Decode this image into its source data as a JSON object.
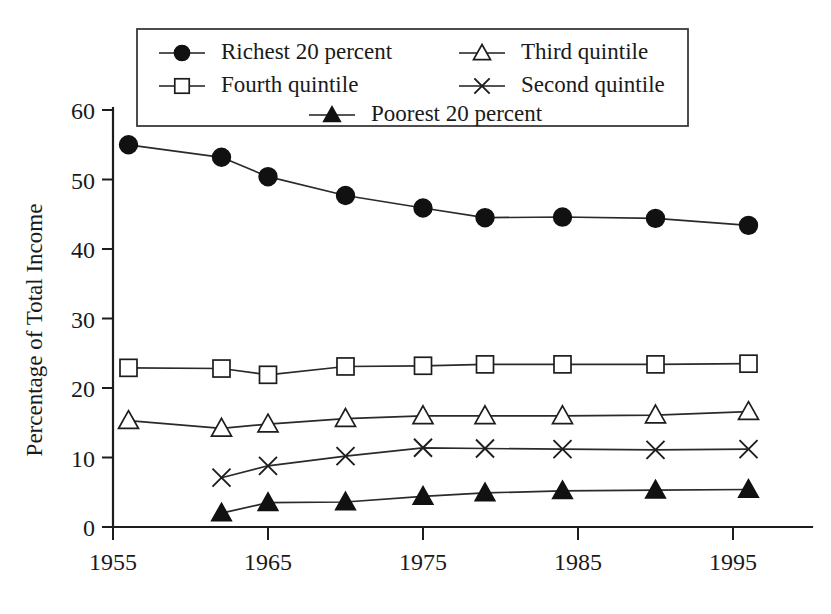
{
  "chart_data": {
    "type": "line",
    "title": "",
    "subtitle": "",
    "xlabel": "",
    "ylabel": "Percentage of Total Income",
    "xlim": [
      1953,
      1999
    ],
    "ylim": [
      0,
      62
    ],
    "grid": false,
    "legend_position": "top-center",
    "y_ticks": [
      0,
      10,
      20,
      30,
      40,
      50,
      60
    ],
    "y_tick_labels": [
      "0",
      "10",
      "20",
      "30",
      "40",
      "50",
      "60"
    ],
    "x_ticks": [
      1955,
      1965,
      1975,
      1985,
      1995
    ],
    "x_tick_labels": [
      "1955",
      "1965",
      "1975",
      "1985",
      "1995"
    ],
    "x": [
      1956,
      1962,
      1965,
      1970,
      1975,
      1979,
      1984,
      1990,
      1996
    ],
    "series": [
      {
        "name": "Richest 20 percent",
        "marker": "filled-circle",
        "x": [
          1956,
          1962,
          1965,
          1970,
          1975,
          1979,
          1984,
          1990,
          1996
        ],
        "values": [
          55.0,
          53.2,
          50.4,
          47.7,
          45.9,
          44.5,
          44.6,
          44.4,
          43.4
        ]
      },
      {
        "name": "Fourth quintile",
        "marker": "open-square",
        "x": [
          1956,
          1962,
          1965,
          1970,
          1975,
          1979,
          1984,
          1990,
          1996
        ],
        "values": [
          22.9,
          22.8,
          21.9,
          23.1,
          23.2,
          23.4,
          23.4,
          23.4,
          23.5
        ]
      },
      {
        "name": "Third quintile",
        "marker": "open-triangle",
        "x": [
          1956,
          1962,
          1965,
          1970,
          1975,
          1979,
          1984,
          1990,
          1996
        ],
        "values": [
          15.3,
          14.2,
          14.8,
          15.6,
          16.0,
          16.0,
          16.0,
          16.1,
          16.6
        ]
      },
      {
        "name": "Second quintile",
        "marker": "cross",
        "x": [
          1962,
          1965,
          1970,
          1975,
          1979,
          1984,
          1990,
          1996
        ],
        "values": [
          7.1,
          8.8,
          10.2,
          11.4,
          11.3,
          11.2,
          11.1,
          11.2
        ]
      },
      {
        "name": "Poorest 20 percent",
        "marker": "filled-triangle",
        "x": [
          1962,
          1965,
          1970,
          1975,
          1979,
          1984,
          1990,
          1996
        ],
        "values": [
          2.0,
          3.5,
          3.6,
          4.4,
          4.9,
          5.2,
          5.3,
          5.4
        ]
      }
    ]
  },
  "legend": {
    "entries": [
      {
        "label": "Richest 20 percent",
        "marker": "filled-circle"
      },
      {
        "label": "Third quintile",
        "marker": "open-triangle"
      },
      {
        "label": "Fourth quintile",
        "marker": "open-square"
      },
      {
        "label": "Second quintile",
        "marker": "cross"
      },
      {
        "label": "Poorest 20 percent",
        "marker": "filled-triangle"
      }
    ]
  },
  "colors": {
    "ink": "#1a1a1a",
    "line": "#2a2a2a",
    "marker_fill": "#111111",
    "marker_open": "#ffffff",
    "background": "#ffffff"
  }
}
